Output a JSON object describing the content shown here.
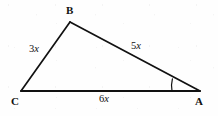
{
  "figure": {
    "kind": "geometry-diagram",
    "shape": "triangle",
    "stroke_color": "#111111",
    "background_color": "#fefefe",
    "vertices": [
      {
        "id": "A",
        "label": "A",
        "x": 200,
        "y": 91,
        "label_x": 195,
        "label_y": 96
      },
      {
        "id": "B",
        "label": "B",
        "x": 70,
        "y": 22,
        "label_x": 66,
        "label_y": 5
      },
      {
        "id": "C",
        "label": "C",
        "x": 21,
        "y": 91,
        "label_x": 11,
        "label_y": 96
      }
    ],
    "sides": [
      {
        "id": "CB",
        "from": "C",
        "to": "B",
        "coefficient": "3",
        "variable": "x",
        "label": "3x",
        "label_x": 29,
        "label_y": 44
      },
      {
        "id": "BA",
        "from": "B",
        "to": "A",
        "coefficient": "5",
        "variable": "x",
        "label": "5x",
        "label_x": 131,
        "label_y": 41
      },
      {
        "id": "CA",
        "from": "C",
        "to": "A",
        "coefficient": "6",
        "variable": "x",
        "label": "6x",
        "label_x": 99,
        "label_y": 94
      }
    ],
    "angle_marks": [
      {
        "id": "angle-A",
        "at_vertex": "A",
        "style": "single-arc",
        "radius": 28
      }
    ]
  }
}
